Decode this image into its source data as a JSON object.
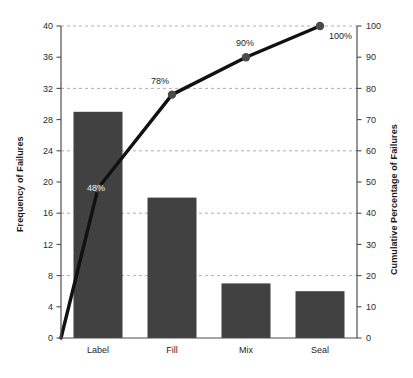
{
  "chart_data": {
    "type": "bar",
    "title": "",
    "subtitle": "",
    "categories": [
      "Label",
      "Fill",
      "Mix",
      "Seal"
    ],
    "values": [
      29,
      18,
      7,
      6
    ],
    "xlabel": "",
    "ylabel": "Frequency of Failures",
    "ylabel_right": "Cumulative Percentage of Failures",
    "ylim": [
      0,
      40
    ],
    "ylim_right": [
      0,
      100
    ],
    "yticks": [
      0,
      4,
      8,
      12,
      16,
      20,
      24,
      28,
      32,
      36,
      40
    ],
    "yticks_right": [
      0,
      10,
      20,
      30,
      40,
      50,
      60,
      70,
      80,
      90,
      100
    ],
    "gridlines_right": [
      20,
      40,
      60,
      80,
      100
    ],
    "grid": true,
    "legend": "none",
    "series": [
      {
        "name": "Frequency of Failures",
        "type": "bar",
        "axis": "left",
        "values": [
          29,
          18,
          7,
          6
        ]
      },
      {
        "name": "Cumulative Percentage of Failures",
        "type": "line",
        "axis": "right",
        "values": [
          48,
          78,
          90,
          100
        ],
        "start_at_origin": true,
        "point_labels": [
          "48%",
          "78%",
          "90%",
          "100%"
        ]
      }
    ],
    "annotations": [
      {
        "text": "48%",
        "category": "Label",
        "value": 48,
        "placement": "inside-bar"
      },
      {
        "text": "78%",
        "category": "Fill",
        "value": 78,
        "placement": "above-left"
      },
      {
        "text": "90%",
        "category": "Mix",
        "value": 90,
        "placement": "above"
      },
      {
        "text": "100%",
        "category": "Seal",
        "value": 100,
        "placement": "right"
      }
    ],
    "colors": {
      "bar": "#414141",
      "line": "#111111",
      "marker": "#4a4a4a",
      "grid": "#9a9a9a",
      "axis": "#4d4d4d",
      "label_inside": "#f2f2f2",
      "label_outside": "#1f1f1f",
      "background": "#ffffff"
    }
  },
  "axes": {
    "left": {
      "title": "Frequency of Failures",
      "ticks": [
        "0",
        "4",
        "8",
        "12",
        "16",
        "20",
        "24",
        "28",
        "32",
        "36",
        "40"
      ]
    },
    "right": {
      "title": "Cumulative Percentage of Failures",
      "ticks": [
        "0",
        "10",
        "20",
        "30",
        "40",
        "50",
        "60",
        "70",
        "80",
        "90",
        "100"
      ]
    },
    "bottom": {
      "ticks": [
        "Label",
        "Fill",
        "Mix",
        "Seal"
      ]
    }
  }
}
